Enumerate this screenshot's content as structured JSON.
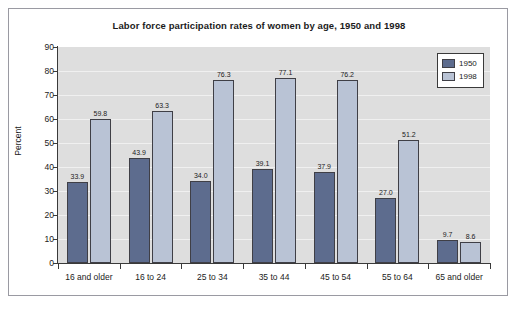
{
  "chart_data": {
    "type": "bar",
    "title": "Labor force participation rates of women by age, 1950 and 1998",
    "xlabel": "",
    "ylabel": "Percent",
    "ylim": [
      0,
      90
    ],
    "yticks": [
      0,
      10,
      20,
      30,
      40,
      50,
      60,
      70,
      80,
      90
    ],
    "grid": true,
    "legend_position": "top-right",
    "categories": [
      "16 and older",
      "16 to 24",
      "25 to 34",
      "35 to 44",
      "45 to 54",
      "55 to 64",
      "65 and older"
    ],
    "series": [
      {
        "name": "1950",
        "color": "#5d6c8e",
        "values": [
          33.9,
          43.9,
          34.0,
          39.1,
          37.9,
          27.0,
          9.7
        ],
        "labels": [
          "33.9",
          "43.9",
          "34.0",
          "39.1",
          "37.9",
          "27.0",
          "9.7"
        ]
      },
      {
        "name": "1998",
        "color": "#b9c3d5",
        "values": [
          59.8,
          63.3,
          76.3,
          77.1,
          76.2,
          51.2,
          8.6
        ],
        "labels": [
          "59.8",
          "63.3",
          "76.3",
          "77.1",
          "76.2",
          "51.2",
          "8.6"
        ]
      }
    ]
  },
  "legend": {
    "entries": [
      {
        "label": "1950",
        "color": "#5d6c8e"
      },
      {
        "label": "1998",
        "color": "#b9c3d5"
      }
    ]
  },
  "colors": {
    "series_1950": "#5d6c8e",
    "series_1998": "#b9c3d5",
    "plot_background": "#dedede",
    "figure_background": "#ffffff",
    "axis": "#3a3a3a",
    "text": "#1b1b1b"
  }
}
